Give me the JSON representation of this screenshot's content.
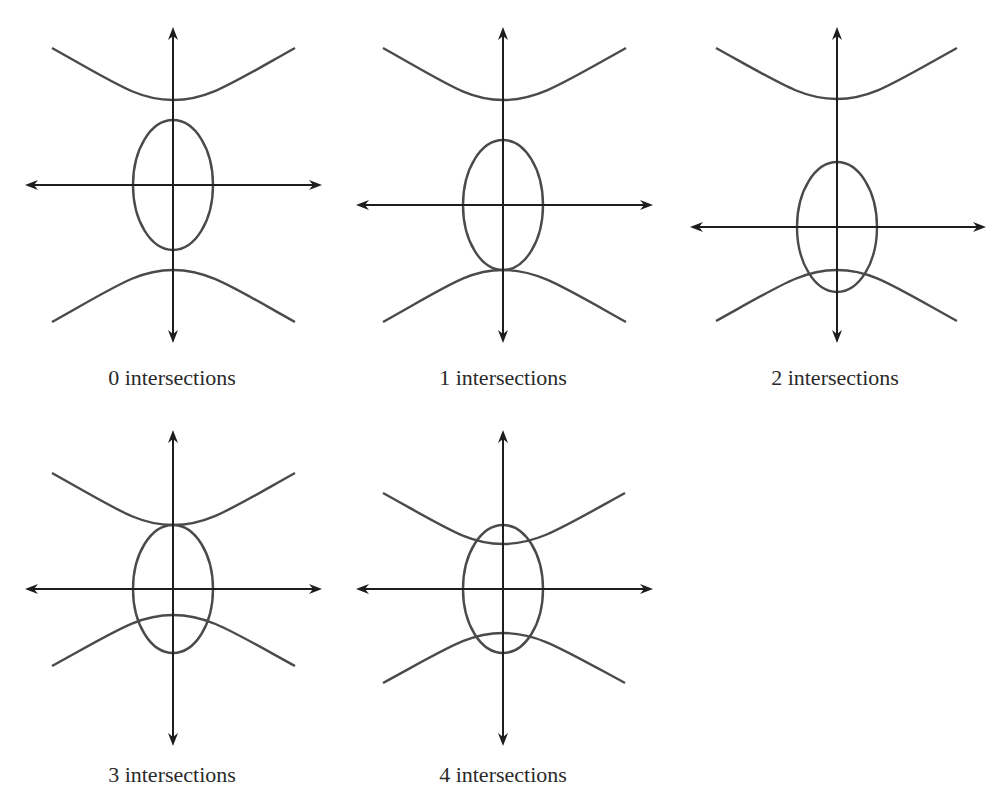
{
  "figure": {
    "panels": [
      {
        "id": "p0",
        "label": "0 intersections",
        "intersections": 0,
        "axis_center": [
          173,
          185
        ],
        "v_axis": [
          27,
          343
        ],
        "h_axis": [
          25,
          322
        ],
        "ellipse": {
          "cx": 173,
          "cy": 185,
          "rx": 40,
          "ry": 65
        },
        "upper_vertex_y": 100,
        "upper_end_y": 48,
        "lower_vertex_y": 270,
        "lower_end_y": 322,
        "hyper_x": [
          52,
          295
        ],
        "label_pos": [
          172,
          378
        ]
      },
      {
        "id": "p1",
        "label": "1 intersections",
        "intersections": 1,
        "axis_center": [
          503,
          205
        ],
        "v_axis": [
          27,
          343
        ],
        "h_axis": [
          356,
          653
        ],
        "ellipse": {
          "cx": 503,
          "cy": 205,
          "rx": 40,
          "ry": 65
        },
        "upper_vertex_y": 100,
        "upper_end_y": 48,
        "lower_vertex_y": 270,
        "lower_end_y": 322,
        "hyper_x": [
          383,
          626
        ],
        "label_pos": [
          503,
          378
        ]
      },
      {
        "id": "p2",
        "label": "2 intersections",
        "intersections": 2,
        "axis_center": [
          837,
          227
        ],
        "v_axis": [
          27,
          343
        ],
        "h_axis": [
          690,
          986
        ],
        "ellipse": {
          "cx": 837,
          "cy": 227,
          "rx": 40,
          "ry": 65
        },
        "upper_vertex_y": 99,
        "upper_end_y": 48,
        "lower_vertex_y": 270,
        "lower_end_y": 321,
        "hyper_x": [
          716,
          957
        ],
        "label_pos": [
          835,
          378
        ]
      },
      {
        "id": "p3",
        "label": "3 intersections",
        "intersections": 3,
        "axis_center": [
          173,
          589
        ],
        "v_axis": [
          430,
          746
        ],
        "h_axis": [
          25,
          322
        ],
        "ellipse": {
          "cx": 173,
          "cy": 589,
          "rx": 40,
          "ry": 64
        },
        "upper_vertex_y": 525,
        "upper_end_y": 473,
        "lower_vertex_y": 615,
        "lower_end_y": 666,
        "hyper_x": [
          52,
          295
        ],
        "label_pos": [
          172,
          775
        ]
      },
      {
        "id": "p4",
        "label": "4 intersections",
        "intersections": 4,
        "axis_center": [
          503,
          589
        ],
        "v_axis": [
          430,
          746
        ],
        "h_axis": [
          356,
          653
        ],
        "ellipse": {
          "cx": 503,
          "cy": 589,
          "rx": 40,
          "ry": 64
        },
        "upper_vertex_y": 544,
        "upper_end_y": 493,
        "lower_vertex_y": 633,
        "lower_end_y": 683,
        "hyper_x": [
          383,
          625
        ],
        "label_pos": [
          503,
          775
        ]
      }
    ]
  },
  "colors": {
    "axis": "#1e1e1e",
    "curve": "#4a4a4a",
    "text": "#2a2a2a",
    "background": "#ffffff"
  }
}
